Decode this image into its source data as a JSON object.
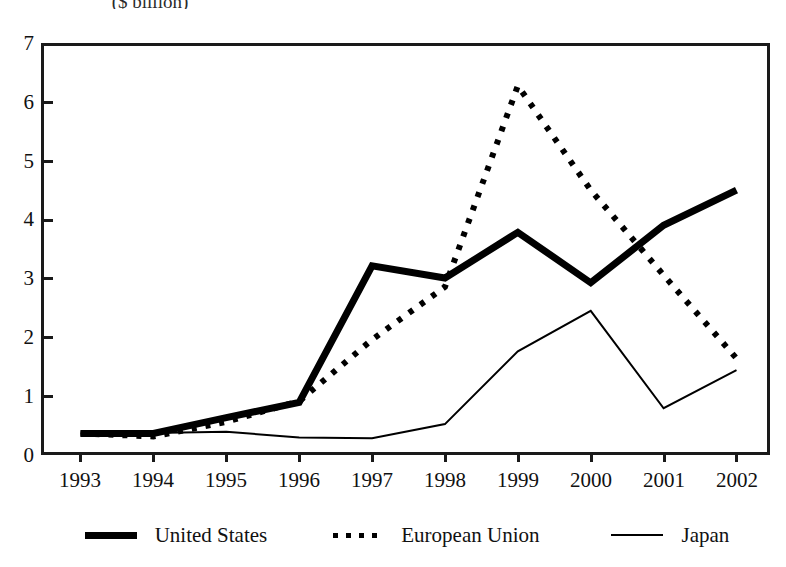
{
  "caption": {
    "unit": "($ billion)"
  },
  "chart_data": {
    "type": "line",
    "title": "",
    "subtitle": "($ billion)",
    "xlabel": "",
    "ylabel": "",
    "unit": "$ billion",
    "categories": [
      "1993",
      "1994",
      "1995",
      "1996",
      "1997",
      "1998",
      "1999",
      "2000",
      "2001",
      "2002"
    ],
    "x": [
      1993,
      1994,
      1995,
      1996,
      1997,
      1998,
      1999,
      2000,
      2001,
      2002
    ],
    "ylim": [
      0,
      7
    ],
    "yticks": [
      0,
      1,
      2,
      3,
      4,
      5,
      6,
      7
    ],
    "ytick_labels": [
      "0",
      "1",
      "2",
      "3",
      "4",
      "5",
      "6",
      "7"
    ],
    "grid": false,
    "legend_position": "bottom",
    "series": [
      {
        "name": "United States",
        "style": "thick-solid",
        "color": "#000000",
        "values": [
          0.35,
          0.35,
          0.62,
          0.88,
          3.21,
          3.0,
          3.78,
          2.92,
          3.9,
          4.5
        ]
      },
      {
        "name": "European Union",
        "style": "dotted",
        "color": "#000000",
        "values": [
          0.35,
          0.3,
          0.55,
          0.9,
          1.95,
          2.85,
          6.28,
          4.5,
          3.05,
          1.63
        ]
      },
      {
        "name": "Japan",
        "style": "thin-solid",
        "color": "#000000",
        "values": [
          0.35,
          0.36,
          0.38,
          0.28,
          0.27,
          0.51,
          1.75,
          2.44,
          0.78,
          1.43
        ]
      }
    ]
  },
  "axes": {
    "y_tick_labels": [
      "7",
      "6",
      "5",
      "4",
      "3",
      "2",
      "1",
      "0"
    ],
    "x_tick_labels": [
      "1993",
      "1994",
      "1995",
      "1996",
      "1997",
      "1998",
      "1999",
      "2000",
      "2001",
      "2002"
    ]
  },
  "legend": {
    "items": [
      {
        "label": "United States",
        "style": "thick-solid"
      },
      {
        "label": "European Union",
        "style": "dotted"
      },
      {
        "label": "Japan",
        "style": "thin-solid"
      }
    ]
  },
  "colors": {
    "line": "#000000",
    "axis": "#1a1a1a",
    "background": "#ffffff"
  }
}
